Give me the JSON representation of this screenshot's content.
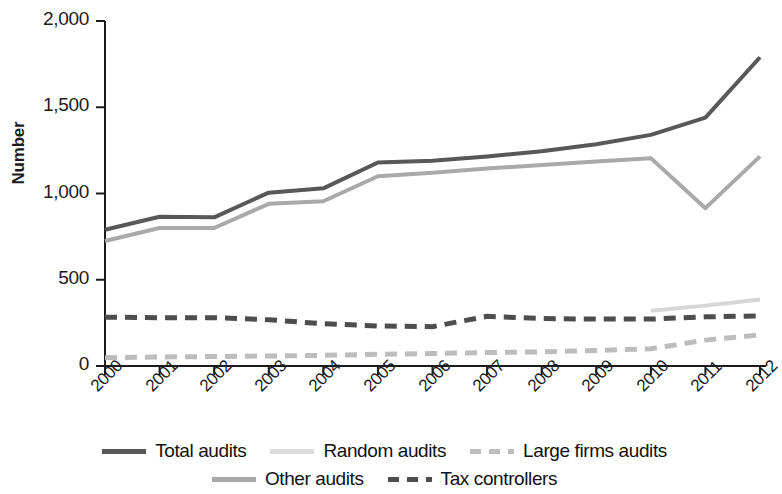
{
  "chart_data": {
    "type": "line",
    "title": "",
    "xlabel": "",
    "ylabel": "Number",
    "categories": [
      "2000",
      "2001",
      "2002",
      "2003",
      "2004",
      "2005",
      "2006",
      "2007",
      "2008",
      "2009",
      "2010",
      "2011",
      "2012"
    ],
    "x": [
      2000,
      2001,
      2002,
      2003,
      2004,
      2005,
      2006,
      2007,
      2008,
      2009,
      2010,
      2011,
      2012
    ],
    "ylim": [
      0,
      2000
    ],
    "yticks": [
      0,
      500,
      1000,
      1500,
      2000
    ],
    "ytick_labels": [
      "0",
      "500",
      "1,000",
      "1,500",
      "2,000"
    ],
    "grid": false,
    "legend_position": "bottom",
    "series": [
      {
        "name": "Total audits",
        "color": "#58585a",
        "style": "solid",
        "values": [
          790,
          865,
          862,
          1005,
          1030,
          1180,
          1190,
          1215,
          1245,
          1285,
          1340,
          1440,
          1790
        ]
      },
      {
        "name": "Other audits",
        "color": "#a9a9ab",
        "style": "solid",
        "values": [
          725,
          800,
          800,
          940,
          955,
          1100,
          1120,
          1145,
          1165,
          1185,
          1205,
          915,
          1215
        ]
      },
      {
        "name": "Random audits",
        "color": "#d6d6d6",
        "style": "solid",
        "values": [
          null,
          null,
          null,
          null,
          null,
          null,
          null,
          null,
          null,
          null,
          320,
          350,
          385
        ]
      },
      {
        "name": "Tax controllers",
        "color": "#4d4d4f",
        "style": "dashed",
        "values": [
          283,
          280,
          280,
          268,
          245,
          232,
          228,
          288,
          275,
          272,
          272,
          285,
          290
        ]
      },
      {
        "name": "Large firms audits",
        "color": "#bdbdbd",
        "style": "dashed",
        "values": [
          48,
          52,
          55,
          58,
          62,
          68,
          72,
          78,
          82,
          90,
          100,
          150,
          180
        ]
      }
    ]
  },
  "legend": {
    "rows": [
      [
        {
          "label": "Total audits",
          "color": "#58585a",
          "style": "solid"
        },
        {
          "label": "Random audits",
          "color": "#dcdcdc",
          "style": "solid"
        },
        {
          "label": "Large firms audits",
          "color": "#bdbdbd",
          "style": "dashed"
        }
      ],
      [
        {
          "label": "Other audits",
          "color": "#a9a9ab",
          "style": "solid"
        },
        {
          "label": "Tax controllers",
          "color": "#4d4d4f",
          "style": "dashed"
        }
      ]
    ]
  },
  "axis": {
    "y_axis_title": "Number"
  }
}
